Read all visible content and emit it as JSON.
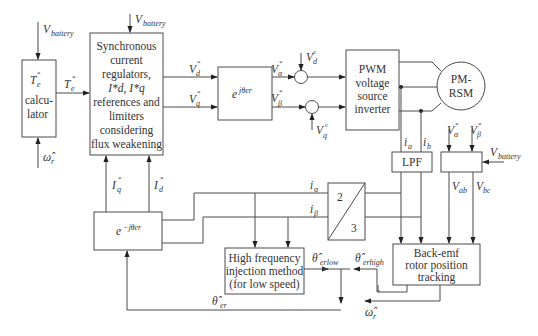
{
  "diagram": {
    "blocks": {
      "torque_calc": {
        "line1": "T",
        "line1_sub": "e",
        "line1_sup": "*",
        "line2": "calcu-",
        "line3": "lator"
      },
      "current_regulators": {
        "lines": [
          "Synchronous",
          "current",
          "regulators,",
          "I*d, I*q",
          "references and",
          "limiters",
          "considering",
          "flux weakening"
        ]
      },
      "rotation_forward": {
        "label": "e",
        "label_sup": "jθer"
      },
      "rotation_inverse": {
        "label": "e",
        "label_sup": "−jθer"
      },
      "pwm_inverter": {
        "lines": [
          "PWM",
          "voltage",
          "source",
          "inverter"
        ]
      },
      "motor": {
        "lines": [
          "PM-",
          "RSM"
        ]
      },
      "lpf": {
        "label": "LPF"
      },
      "voltage_calc": {
        "label": ""
      },
      "clarke": {
        "top": "2",
        "bottom": "3"
      },
      "hfi": {
        "lines": [
          "High frequency",
          "injection method",
          "(for low speed)"
        ]
      },
      "back_emf": {
        "lines": [
          "Back-emf",
          "rotor position",
          "tracking"
        ]
      }
    },
    "signals": {
      "v_battery_1": {
        "base": "V",
        "sub": "battery"
      },
      "v_battery_2": {
        "base": "V",
        "sub": "battery"
      },
      "v_battery_3": {
        "base": "V",
        "sub": "battery"
      },
      "omega_r_in": {
        "base": "ω̂",
        "sub": "r"
      },
      "omega_r_out": {
        "base": "ω̂",
        "sub": "r"
      },
      "te_ref": {
        "base": "T",
        "sub": "e",
        "sup": "*"
      },
      "vd_ref": {
        "base": "V",
        "sub": "d",
        "sup": "*"
      },
      "vq_ref": {
        "base": "V",
        "sub": "q",
        "sup": "*"
      },
      "valpha_ref": {
        "base": "V",
        "sub": "α",
        "sup": "*"
      },
      "vbeta_ref": {
        "base": "V",
        "sub": "β",
        "sup": "*"
      },
      "vd_comp": {
        "base": "V",
        "sub": "d",
        "sup": "c"
      },
      "vq_comp": {
        "base": "V",
        "sub": "q",
        "sup": "c"
      },
      "iq_ref": {
        "base": "I",
        "sub": "q",
        "sup": "*"
      },
      "id_ref": {
        "base": "I",
        "sub": "d",
        "sup": "*"
      },
      "ia": {
        "base": "i",
        "sub": "a"
      },
      "ib": {
        "base": "i",
        "sub": "b"
      },
      "i_alpha": {
        "base": "i",
        "sub": "α"
      },
      "i_beta": {
        "base": "i",
        "sub": "β"
      },
      "valpha_ref2": {
        "base": "V",
        "sub": "α",
        "sup": "*"
      },
      "vbeta_ref2": {
        "base": "V",
        "sub": "β",
        "sup": "*"
      },
      "vab": {
        "base": "V",
        "sub": "ab"
      },
      "vbc": {
        "base": "V",
        "sub": "bc"
      },
      "theta_low": {
        "base": "θ̂",
        "sub": "erlow"
      },
      "theta_high": {
        "base": "θ̂",
        "sub": "erhigh"
      },
      "theta_er": {
        "base": "θ̂",
        "sub": "er"
      }
    },
    "colors": {
      "line": "#4a4a4a",
      "text": "#333333",
      "background": "#ffffff"
    }
  }
}
